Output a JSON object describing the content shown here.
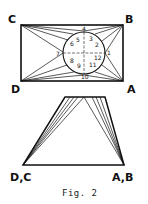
{
  "figure": {
    "caption": "Fig. 2",
    "top_diagram": {
      "corners": {
        "C": "C",
        "B": "B",
        "D": "D",
        "A": "A"
      },
      "circle_points": [
        "1",
        "2",
        "3",
        "4",
        "5",
        "6",
        "7",
        "8",
        "9",
        "10",
        "11",
        "12"
      ]
    },
    "bottom_diagram": {
      "left_label": "D,C",
      "right_label": "A,B"
    }
  }
}
